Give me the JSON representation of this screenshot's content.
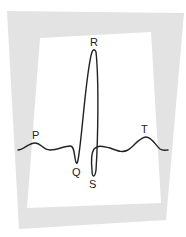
{
  "diagram": {
    "type": "ecg-waveform",
    "colors": {
      "background": "#ffffff",
      "frame": "#e3e3e3",
      "panel": "#ffffff",
      "trace": "#222222",
      "label": "#222222"
    },
    "labels": {
      "p": "P",
      "q": "Q",
      "r": "R",
      "s": "S",
      "t": "T"
    }
  }
}
